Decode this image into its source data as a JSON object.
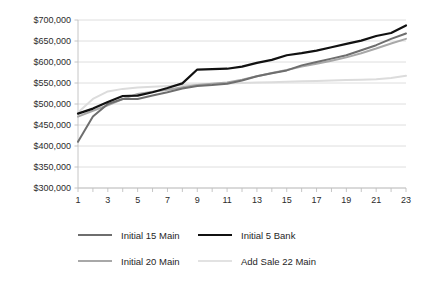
{
  "chart_data": {
    "type": "line",
    "title": "",
    "xlabel": "",
    "ylabel": "",
    "x": [
      1,
      2,
      3,
      4,
      5,
      6,
      7,
      8,
      9,
      10,
      11,
      12,
      13,
      14,
      15,
      16,
      17,
      18,
      19,
      20,
      21,
      22,
      23
    ],
    "xtick_labels": [
      "1",
      "3",
      "5",
      "7",
      "9",
      "11",
      "13",
      "15",
      "17",
      "19",
      "21",
      "23"
    ],
    "xlim": [
      1,
      23
    ],
    "ylim": [
      300000,
      700000
    ],
    "ytick_labels": [
      "$700,000",
      "$650,000",
      "$600,000",
      "$550,000",
      "$500,000",
      "$450,000",
      "$400,000",
      "$350,000",
      "$300,000"
    ],
    "ytick_values": [
      700000,
      650000,
      600000,
      550000,
      500000,
      450000,
      400000,
      350000,
      300000
    ],
    "grid": true,
    "legend_position": "bottom",
    "series": [
      {
        "name": "Initial 15 Main",
        "color": "#6e6e6e",
        "width": 2.0,
        "values": [
          410000,
          470000,
          500000,
          512000,
          512000,
          520000,
          528000,
          537000,
          543000,
          545000,
          548000,
          556000,
          566000,
          573000,
          580000,
          592000,
          600000,
          608000,
          616000,
          628000,
          640000,
          655000,
          668000
        ]
      },
      {
        "name": "Initial  5 Bank",
        "color": "#111111",
        "width": 2.2,
        "values": [
          477000,
          489000,
          505000,
          519000,
          520000,
          528000,
          538000,
          549000,
          582000,
          583000,
          584000,
          589000,
          598000,
          605000,
          616000,
          621000,
          627000,
          635000,
          643000,
          651000,
          662000,
          669000,
          687000
        ]
      },
      {
        "name": "Initial 20 Main",
        "color": "#a8a8a8",
        "width": 2.0,
        "values": [
          470000,
          484000,
          497000,
          512000,
          524000,
          529000,
          534000,
          540000,
          545000,
          548000,
          551000,
          558000,
          566000,
          574000,
          581000,
          589000,
          596000,
          603000,
          611000,
          621000,
          632000,
          644000,
          655000
        ]
      },
      {
        "name": "Add Sale 22 Main",
        "color": "#dcdcdc",
        "width": 2.0,
        "values": [
          480000,
          512000,
          530000,
          536000,
          539000,
          541000,
          543000,
          545000,
          547000,
          548000,
          549000,
          550000,
          551000,
          552000,
          553000,
          554000,
          555000,
          556000,
          557000,
          558000,
          559000,
          562000,
          567000
        ]
      }
    ]
  },
  "legend": {
    "items": [
      {
        "label": "Initial 15 Main",
        "color": "#6e6e6e",
        "width": "2px"
      },
      {
        "label": "Initial  5 Bank",
        "color": "#111111",
        "width": "2.4px"
      },
      {
        "label": "Initial 20 Main",
        "color": "#a8a8a8",
        "width": "2px"
      },
      {
        "label": "Add Sale 22 Main",
        "color": "#e2e2e2",
        "width": "2px"
      }
    ]
  },
  "plot_geometry": {
    "left": 78,
    "right": 406,
    "top": 20,
    "bottom": 188
  }
}
